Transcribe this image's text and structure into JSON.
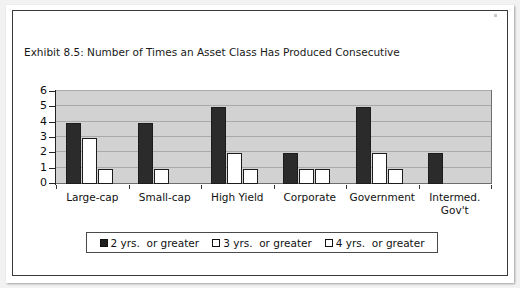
{
  "chart_data": {
    "type": "bar",
    "title": "Exhibit 8.5: Number of Times an Asset Class Has Produced Consecutive Negative Annual Returns",
    "title_line_1": "Exhibit 8.5: Number of Times an Asset Class Has Produced Consecutive",
    "title_line_2": "Negative Annual Returns",
    "xlabel": "",
    "ylabel": "",
    "ylim": [
      0,
      6
    ],
    "yticks": [
      0,
      1,
      2,
      3,
      4,
      5,
      6
    ],
    "ytick_labels": [
      "0",
      "1",
      "2",
      "3",
      "4",
      "5",
      "6"
    ],
    "grid": true,
    "legend_position": "bottom",
    "categories": [
      "Large-cap",
      "Small-cap",
      "High Yield",
      "Corporate",
      "Government",
      "Intermed. Gov't"
    ],
    "category_labels_multiline": [
      [
        "Large-cap"
      ],
      [
        "Small-cap"
      ],
      [
        "High Yield"
      ],
      [
        "Corporate"
      ],
      [
        "Government"
      ],
      [
        "Intermed.",
        "Gov't"
      ]
    ],
    "series": [
      {
        "name": "2 yrs.  or greater",
        "color": "#2b2b2b",
        "values": [
          4,
          4,
          5,
          2,
          5,
          2
        ]
      },
      {
        "name": "3 yrs.  or greater",
        "color": "#ffffff",
        "values": [
          3,
          1,
          2,
          1,
          2,
          0
        ]
      },
      {
        "name": "4 yrs.  or greater",
        "color": "#ffffff",
        "values": [
          1,
          0,
          1,
          1,
          1,
          0
        ]
      }
    ]
  },
  "legend": {
    "items": [
      {
        "label": "2 yrs.  or greater",
        "swatch": "filled-black-square"
      },
      {
        "label": "3 yrs.  or greater",
        "swatch": "outlined-white-square"
      },
      {
        "label": "4 yrs.  or greater",
        "swatch": "outlined-white-square"
      }
    ]
  },
  "axis": {
    "y_tick_labels": [
      "6",
      "5",
      "4",
      "3",
      "2",
      "1",
      "0"
    ]
  },
  "colors": {
    "plot_background": "#d2d2d2",
    "gridline": "#a9a9a9",
    "panel_background": "#ffffff",
    "page_background": "#f2f2f2",
    "border": "#3a3a3a",
    "series_2yr": "#2b2b2b",
    "series_3yr": "#ffffff",
    "series_4yr": "#ffffff"
  }
}
